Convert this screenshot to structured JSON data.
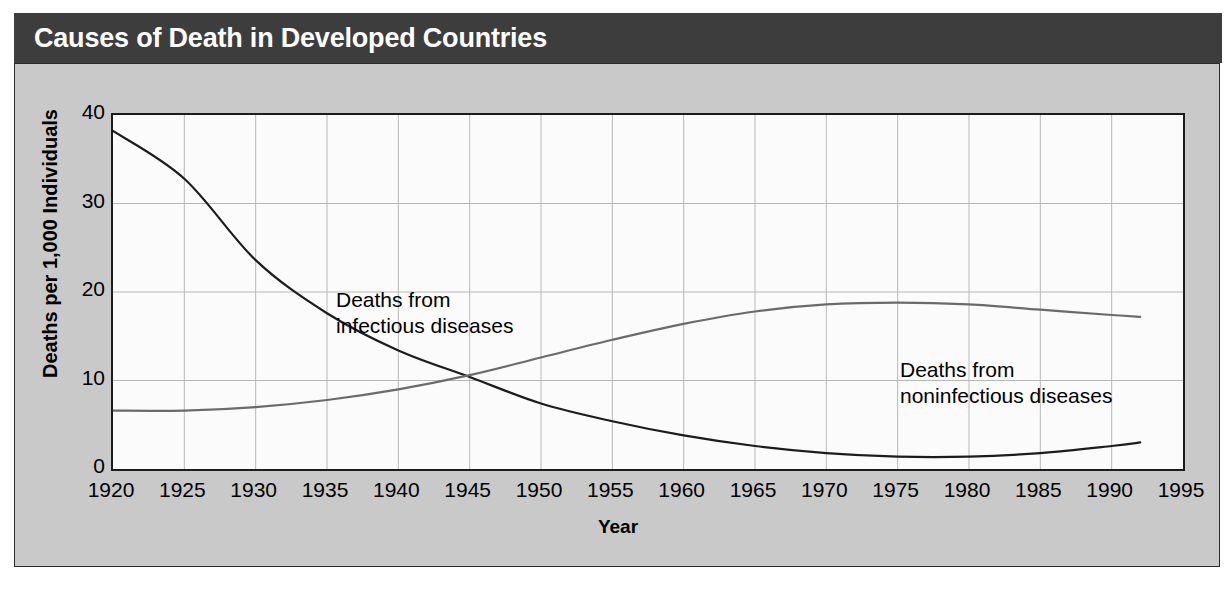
{
  "header": {
    "title": "Causes of Death in Developed Countries",
    "bar_color": "#3d3d3d",
    "text_color": "#ffffff"
  },
  "panel": {
    "background_color": "#c9c9c9",
    "border_color": "#2a2a2a"
  },
  "chart_data": {
    "type": "line",
    "title": "Causes of Death in Developed Countries",
    "xlabel": "Year",
    "ylabel": "Deaths per 1,000 Individuals",
    "xlim": [
      1920,
      1995
    ],
    "ylim": [
      0,
      40
    ],
    "xticks": [
      1920,
      1925,
      1930,
      1935,
      1940,
      1945,
      1950,
      1955,
      1960,
      1965,
      1970,
      1975,
      1980,
      1985,
      1990,
      1995
    ],
    "yticks": [
      0,
      10,
      20,
      30,
      40
    ],
    "xtick_labels": [
      "1920",
      "1925",
      "1930",
      "1935",
      "1940",
      "1945",
      "1950",
      "1955",
      "1960",
      "1965",
      "1970",
      "1975",
      "1980",
      "1985",
      "1990",
      "1995"
    ],
    "ytick_labels": [
      "0",
      "10",
      "20",
      "30",
      "40"
    ],
    "grid": true,
    "grid_color": "#b8b8b8",
    "plot_background": "#fbfbfb",
    "axis_color": "#1c1c1c",
    "legend": "annotations-in-plot",
    "annotations": [
      {
        "name": "infectious-label",
        "text": "Deaths from\ninfectious diseases",
        "near_x": 1936,
        "near_y": 29
      },
      {
        "name": "noninfectious-label",
        "text": "Deaths from\nnoninfectious diseases",
        "near_x": 1968,
        "near_y": 24
      }
    ],
    "x": [
      1920,
      1925,
      1930,
      1935,
      1940,
      1945,
      1950,
      1955,
      1960,
      1965,
      1970,
      1975,
      1980,
      1985,
      1990,
      1992
    ],
    "series": [
      {
        "name": "Deaths from infectious diseases",
        "color": "#1c1c1c",
        "values": [
          38.2,
          32.8,
          23.6,
          17.6,
          13.4,
          10.4,
          7.4,
          5.4,
          3.8,
          2.6,
          1.8,
          1.4,
          1.4,
          1.8,
          2.6,
          3.0
        ]
      },
      {
        "name": "Deaths from noninfectious diseases",
        "color": "#6b6b6b",
        "values": [
          6.6,
          6.6,
          7.0,
          7.8,
          9.0,
          10.6,
          12.6,
          14.6,
          16.4,
          17.8,
          18.6,
          18.8,
          18.6,
          18.0,
          17.4,
          17.2
        ]
      }
    ]
  }
}
